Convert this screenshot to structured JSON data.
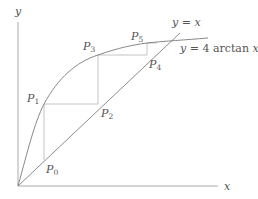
{
  "diagram": {
    "type": "cobweb-iteration",
    "axes": {
      "x_label": "x",
      "y_label": "y"
    },
    "curves": [
      {
        "id": "identity",
        "label": "y = x",
        "label_parts": {
          "lhs": "y",
          "eq": " = ",
          "rhs": "x"
        }
      },
      {
        "id": "arctan",
        "label": "y = 4 arctan x",
        "label_parts": {
          "lhs": "y",
          "eq": " = 4 ",
          "fn": "arctan",
          "arg": " x"
        }
      }
    ],
    "points": [
      {
        "name": "P",
        "sub": "0"
      },
      {
        "name": "P",
        "sub": "1"
      },
      {
        "name": "P",
        "sub": "2"
      },
      {
        "name": "P",
        "sub": "3"
      },
      {
        "name": "P",
        "sub": "4"
      },
      {
        "name": "P",
        "sub": "5"
      }
    ],
    "colors": {
      "curve": "#7a7a7a",
      "axis": "#9a9a9a",
      "cobweb": "#b0b0b0",
      "text": "#555555"
    }
  }
}
